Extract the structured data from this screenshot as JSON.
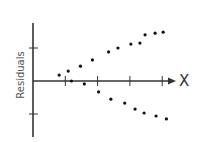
{
  "chart_data": {
    "type": "scatter",
    "title": "",
    "xlabel": "X",
    "ylabel": "Residuals",
    "grid": false,
    "legend": null,
    "x_ticks": [
      1,
      2,
      3,
      4
    ],
    "y_ticks": [
      -1,
      0,
      1
    ],
    "xlim": [
      0,
      4.5
    ],
    "ylim": [
      -1.7,
      1.8
    ],
    "series": [
      {
        "name": "upper",
        "points": [
          [
            0.81,
            0.18
          ],
          [
            1.09,
            0.3
          ],
          [
            1.47,
            0.45
          ],
          [
            1.84,
            0.64
          ],
          [
            2.34,
            0.88
          ],
          [
            2.63,
            1.0
          ],
          [
            3.03,
            1.12
          ],
          [
            3.31,
            1.15
          ],
          [
            3.47,
            1.4
          ],
          [
            3.78,
            1.45
          ],
          [
            4.03,
            1.48
          ]
        ]
      },
      {
        "name": "lower",
        "points": [
          [
            1.19,
            0.0
          ],
          [
            1.59,
            -0.09
          ],
          [
            2.03,
            -0.33
          ],
          [
            2.41,
            -0.55
          ],
          [
            2.84,
            -0.67
          ],
          [
            3.16,
            -0.85
          ],
          [
            3.44,
            -0.97
          ],
          [
            3.81,
            -1.06
          ],
          [
            4.13,
            -1.15
          ]
        ]
      }
    ],
    "style": {
      "axis_color": "#333333",
      "point_color": "#111111"
    }
  },
  "labels": {
    "x": "X",
    "y": "Residuals"
  }
}
